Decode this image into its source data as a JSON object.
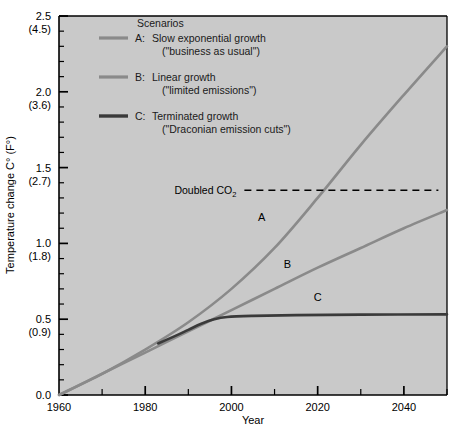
{
  "chart_data": {
    "type": "line",
    "title": "",
    "xlabel": "Year",
    "ylabel": "Temperature change C° (F°)",
    "xlim": [
      1960,
      2050
    ],
    "ylim": [
      0.0,
      2.5
    ],
    "grid": false,
    "legend_position": "top-left-inside",
    "legend_title": "Scenarios",
    "x_ticks": [
      1960,
      1980,
      2000,
      2020,
      2040
    ],
    "x_tick_labels": [
      "1960",
      "1980",
      "2000",
      "2020",
      "2040"
    ],
    "x_minor_tick_interval": 10,
    "y_ticks": [
      0.0,
      0.5,
      1.0,
      1.5,
      2.0,
      2.5
    ],
    "y_tick_labels": [
      "0.0",
      "0.5",
      "1.0",
      "1.5",
      "2.0",
      "2.5"
    ],
    "y_tick_sublabels": [
      "",
      "(0.9)",
      "(1.8)",
      "(2.7)",
      "(3.6)",
      "(4.5)"
    ],
    "y_minor_tick_interval": 0.1,
    "annotations": [
      {
        "text": "Doubled CO2",
        "text_display": "Doubled CO",
        "subscript": "2",
        "type": "dashed-horizontal-line",
        "y_value": 1.35,
        "x_start": 2003,
        "x_end": 2048,
        "label_x": 1990,
        "label_y": 1.35
      }
    ],
    "series": [
      {
        "name": "A",
        "label": "A",
        "legend_key": "A:",
        "legend_line1": "Slow exponential growth",
        "legend_line2": "(\"business as usual\")",
        "color": "#8a8a8a",
        "linewidth": 2.6,
        "label_x": 2007,
        "label_y": 1.15,
        "x": [
          1960,
          1970,
          1980,
          1990,
          2000,
          2010,
          2020,
          2030,
          2040,
          2050
        ],
        "y": [
          0.0,
          0.14,
          0.3,
          0.48,
          0.7,
          0.97,
          1.3,
          1.65,
          1.98,
          2.3
        ]
      },
      {
        "name": "B",
        "label": "B",
        "legend_key": "B:",
        "legend_line1": "Linear growth",
        "legend_line2": "(\"limited emissions\")",
        "color": "#8a8a8a",
        "linewidth": 2.6,
        "label_x": 2013,
        "label_y": 0.84,
        "x": [
          1960,
          1970,
          1980,
          1990,
          2000,
          2010,
          2020,
          2030,
          2040,
          2050
        ],
        "y": [
          0.0,
          0.14,
          0.28,
          0.42,
          0.56,
          0.7,
          0.84,
          0.97,
          1.1,
          1.22
        ]
      },
      {
        "name": "C",
        "label": "C",
        "legend_key": "C:",
        "legend_line1": "Terminated growth",
        "legend_line2": "(\"Draconian emission cuts\")",
        "color": "#3a3a3a",
        "linewidth": 2.6,
        "label_x": 2020,
        "label_y": 0.62,
        "x": [
          1983,
          1987,
          1990,
          1993,
          1996,
          1999,
          2005,
          2015,
          2030,
          2050
        ],
        "y": [
          0.34,
          0.39,
          0.43,
          0.47,
          0.5,
          0.515,
          0.522,
          0.527,
          0.53,
          0.532
        ]
      }
    ]
  },
  "colors": {
    "plot_background": "#c9c9c9",
    "figure_background": "#ffffff",
    "axis": "#000000",
    "series_a": "#8a8a8a",
    "series_b": "#8a8a8a",
    "series_c": "#3a3a3a",
    "text": "#000000"
  }
}
